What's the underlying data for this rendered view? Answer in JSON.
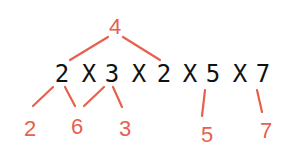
{
  "diagram": {
    "type": "factor-tree",
    "expression": {
      "tokens": [
        "2",
        "X",
        "3",
        "X",
        "2",
        "X",
        "5",
        "X",
        "7"
      ],
      "text": "2 X 3 X 2 X 5 X 7"
    },
    "top_group": {
      "label": "4",
      "covers": [
        "2",
        "2"
      ]
    },
    "bottom_groups": [
      {
        "label": "2",
        "from": [
          "2"
        ]
      },
      {
        "label": "6",
        "from": [
          "2",
          "3"
        ]
      },
      {
        "label": "3",
        "from": [
          "3"
        ]
      },
      {
        "label": "5",
        "from": [
          "5"
        ]
      },
      {
        "label": "7",
        "from": [
          "7"
        ]
      }
    ],
    "colors": {
      "accent": "#e8604d",
      "expression": "#111111",
      "background": "#ffffff"
    }
  }
}
